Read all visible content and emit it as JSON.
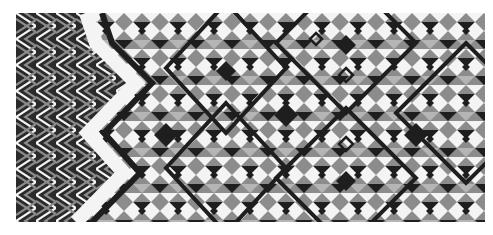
{
  "image": {
    "subject": "woven textile with geometric pattern",
    "regions": [
      {
        "name": "chevron-band",
        "description": "diagonal zigzag stripes in black, grey and white"
      },
      {
        "name": "zigzag-divider",
        "description": "white zigzag band separating sections"
      },
      {
        "name": "diamond-field",
        "description": "interlocking diamonds and triangles in black, grey and white"
      }
    ],
    "colors": {
      "black": "#1e1e1e",
      "grey": "#8c8c8c",
      "light_grey": "#b5b5b5",
      "white": "#f4f4f4",
      "background": "#ffffff"
    }
  }
}
